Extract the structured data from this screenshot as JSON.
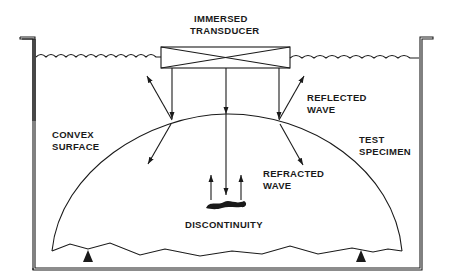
{
  "diagram": {
    "type": "ultrasonic-immersion-testing",
    "labels": {
      "transducer_line1": "IMMERSED",
      "transducer_line2": "TRANSDUCER",
      "reflected_line1": "REFLECTED",
      "reflected_line2": "WAVE",
      "convex_line1": "CONVEX",
      "convex_line2": "SURFACE",
      "test_line1": "TEST",
      "test_line2": "SPECIMEN",
      "refracted_line1": "REFRACTED",
      "refracted_line2": "WAVE",
      "discontinuity": "DISCONTINUITY"
    },
    "colors": {
      "line": "#1a1a1a",
      "background": "#ffffff"
    }
  }
}
